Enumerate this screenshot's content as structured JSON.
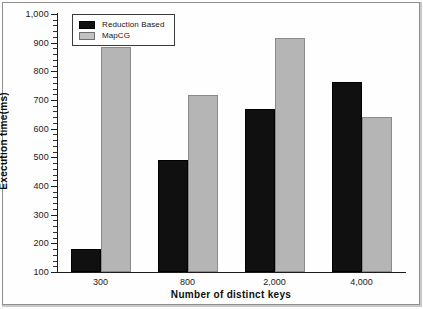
{
  "chart_data": {
    "type": "bar",
    "title": "",
    "xlabel": "Number of distinct keys",
    "ylabel": "Execution time(ms)",
    "categories": [
      "300",
      "800",
      "2,000",
      "4,000"
    ],
    "series": [
      {
        "name": "Reduction Based",
        "color": "#101010",
        "values": [
          180,
          490,
          670,
          763
        ]
      },
      {
        "name": "MapCG",
        "color": "#b5b5b5",
        "values": [
          885,
          718,
          918,
          640
        ]
      }
    ],
    "ylim": [
      100,
      1000
    ],
    "ytick_labels": [
      "1,000",
      "900",
      "800",
      "700",
      "600",
      "500",
      "400",
      "300",
      "200",
      "100"
    ],
    "ytick_values": [
      1000,
      900,
      800,
      700,
      600,
      500,
      400,
      300,
      200,
      100
    ],
    "ytick_step": 100,
    "yminor_step": 20,
    "grid": false,
    "legend_position": "top-left"
  },
  "legend": {
    "entries": [
      {
        "label": "Reduction Based"
      },
      {
        "label": "MapCG"
      }
    ]
  }
}
